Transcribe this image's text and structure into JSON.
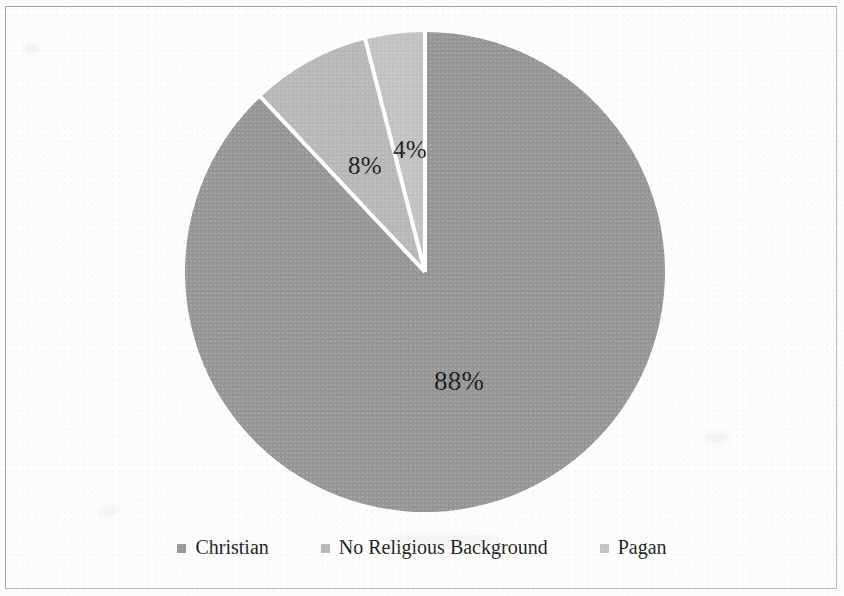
{
  "page": {
    "width": 844,
    "height": 596,
    "background": "#fdfdfd",
    "border_color": "#b9b9b9"
  },
  "chart_data": {
    "type": "pie",
    "title": "",
    "subtitle": "",
    "xlabel": "",
    "ylabel": "",
    "grid": false,
    "legend_position": "bottom",
    "start_angle_deg": 0,
    "direction": "clockwise",
    "center": {
      "x": 425,
      "y": 272
    },
    "radius": 240,
    "separator_color": "#ffffff",
    "separator_width": 4,
    "categories": [
      "Christian",
      "No Religious Background",
      "Pagan"
    ],
    "values": [
      88,
      8,
      4
    ],
    "value_unit": "%",
    "data_labels": [
      "88%",
      "8%",
      "4%"
    ],
    "colors": [
      "#969696",
      "#b8b8b8",
      "#c2c2c2"
    ],
    "slices": [
      {
        "label": "Christian",
        "value": 88,
        "display": "88%",
        "color": "#969696",
        "start_deg": 0,
        "end_deg": 316.8,
        "label_x": 455,
        "label_y": 383
      },
      {
        "label": "No Religious Background",
        "value": 8,
        "display": "8%",
        "color": "#b8b8b8",
        "start_deg": 316.8,
        "end_deg": 345.6,
        "label_x": 366,
        "label_y": 168
      },
      {
        "label": "Pagan",
        "value": 4,
        "display": "4%",
        "color": "#c2c2c2",
        "start_deg": 345.6,
        "end_deg": 360,
        "label_x": 412,
        "label_y": 152
      }
    ]
  },
  "labels": {
    "christian_pct": "88%",
    "no_religious_background_pct": "8%",
    "pagan_pct": "4%"
  },
  "legend": {
    "items": [
      {
        "label": "Christian",
        "color": "#969696"
      },
      {
        "label": "No Religious Background",
        "color": "#b8b8b8"
      },
      {
        "label": "Pagan",
        "color": "#c2c2c2"
      }
    ]
  }
}
